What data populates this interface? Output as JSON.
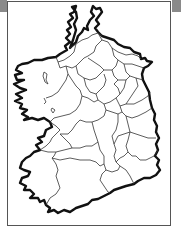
{
  "map": {
    "subject": "Ireland",
    "description": "Outline map of the island of Ireland showing county boundaries",
    "colors": {
      "background": "#ffffff",
      "coastline": "#111111",
      "boundaries": "#333333",
      "frame": "#555555",
      "corner_bars": "#8a8a8a"
    },
    "labels": []
  }
}
